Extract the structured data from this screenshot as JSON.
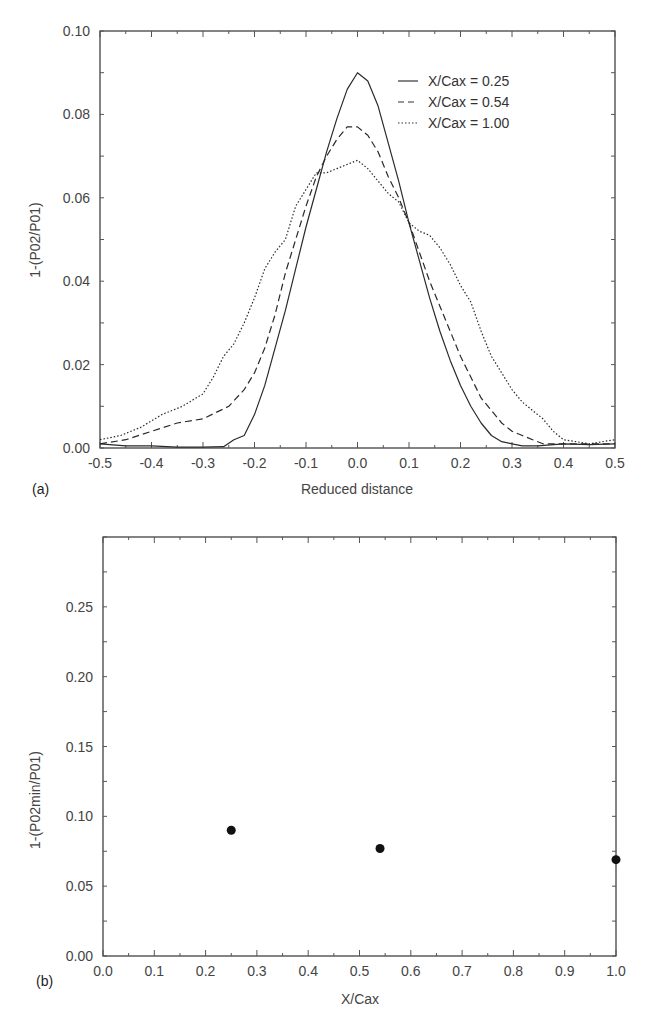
{
  "chart_data": [
    {
      "panel": "(a)",
      "type": "line",
      "xlabel": "Reduced distance",
      "ylabel": "1-(P02/P01)",
      "xlim": [
        -0.5,
        0.5
      ],
      "ylim": [
        0.0,
        0.1
      ],
      "xticks": [
        "-0.5",
        "-0.4",
        "-0.3",
        "-0.2",
        "-0.1",
        "0.0",
        "0.1",
        "0.2",
        "0.3",
        "0.4",
        "0.5"
      ],
      "yticks": [
        "0.00",
        "0.02",
        "0.04",
        "0.06",
        "0.08",
        "0.10"
      ],
      "grid": false,
      "legend_position": "upper right",
      "series": [
        {
          "name": "X/Cax = 0.25",
          "style": "solid",
          "x": [
            -0.5,
            -0.45,
            -0.4,
            -0.35,
            -0.3,
            -0.26,
            -0.24,
            -0.22,
            -0.2,
            -0.18,
            -0.16,
            -0.14,
            -0.12,
            -0.1,
            -0.08,
            -0.06,
            -0.04,
            -0.02,
            0.0,
            0.02,
            0.04,
            0.06,
            0.08,
            0.1,
            0.12,
            0.14,
            0.16,
            0.18,
            0.2,
            0.22,
            0.24,
            0.26,
            0.28,
            0.3,
            0.32,
            0.35,
            0.4,
            0.45,
            0.5
          ],
          "y": [
            0.001,
            0.0005,
            0.0005,
            0.0002,
            0.0002,
            0.0003,
            0.002,
            0.003,
            0.008,
            0.015,
            0.024,
            0.033,
            0.043,
            0.053,
            0.062,
            0.071,
            0.079,
            0.086,
            0.09,
            0.088,
            0.082,
            0.073,
            0.064,
            0.054,
            0.045,
            0.036,
            0.028,
            0.021,
            0.015,
            0.01,
            0.006,
            0.003,
            0.0015,
            0.001,
            0.0005,
            0.0005,
            0.001,
            0.0008,
            0.001
          ]
        },
        {
          "name": "X/Cax = 0.54",
          "style": "dashed",
          "x": [
            -0.5,
            -0.45,
            -0.4,
            -0.35,
            -0.3,
            -0.25,
            -0.22,
            -0.2,
            -0.18,
            -0.16,
            -0.14,
            -0.12,
            -0.1,
            -0.08,
            -0.06,
            -0.04,
            -0.02,
            0.0,
            0.02,
            0.04,
            0.06,
            0.08,
            0.1,
            0.12,
            0.14,
            0.16,
            0.18,
            0.2,
            0.22,
            0.24,
            0.26,
            0.28,
            0.3,
            0.32,
            0.34,
            0.36,
            0.38,
            0.4,
            0.45,
            0.5
          ],
          "y": [
            0.001,
            0.002,
            0.004,
            0.006,
            0.007,
            0.01,
            0.014,
            0.018,
            0.024,
            0.032,
            0.042,
            0.05,
            0.058,
            0.065,
            0.07,
            0.074,
            0.077,
            0.077,
            0.075,
            0.071,
            0.065,
            0.06,
            0.054,
            0.047,
            0.04,
            0.034,
            0.028,
            0.022,
            0.017,
            0.012,
            0.009,
            0.006,
            0.004,
            0.003,
            0.002,
            0.001,
            0.001,
            0.001,
            0.001,
            0.001
          ]
        },
        {
          "name": "X/Cax = 1.00",
          "style": "dotted",
          "x": [
            -0.5,
            -0.46,
            -0.42,
            -0.38,
            -0.34,
            -0.3,
            -0.28,
            -0.26,
            -0.24,
            -0.22,
            -0.2,
            -0.18,
            -0.16,
            -0.14,
            -0.12,
            -0.1,
            -0.08,
            -0.06,
            -0.04,
            -0.02,
            0.0,
            0.02,
            0.04,
            0.06,
            0.08,
            0.1,
            0.12,
            0.14,
            0.16,
            0.18,
            0.2,
            0.22,
            0.24,
            0.26,
            0.28,
            0.3,
            0.32,
            0.34,
            0.36,
            0.38,
            0.4,
            0.45,
            0.5
          ],
          "y": [
            0.002,
            0.003,
            0.005,
            0.008,
            0.01,
            0.013,
            0.017,
            0.022,
            0.025,
            0.03,
            0.036,
            0.043,
            0.047,
            0.05,
            0.058,
            0.062,
            0.066,
            0.066,
            0.067,
            0.068,
            0.069,
            0.067,
            0.064,
            0.061,
            0.059,
            0.054,
            0.052,
            0.051,
            0.048,
            0.044,
            0.039,
            0.035,
            0.028,
            0.022,
            0.018,
            0.014,
            0.011,
            0.009,
            0.007,
            0.004,
            0.002,
            0.001,
            0.002
          ]
        }
      ]
    },
    {
      "panel": "(b)",
      "type": "scatter",
      "xlabel": "X/Cax",
      "ylabel": "1-(P02min/P01)",
      "xlim": [
        0.0,
        1.0
      ],
      "ylim": [
        0.0,
        0.3
      ],
      "xticks": [
        "0.0",
        "0.1",
        "0.2",
        "0.3",
        "0.4",
        "0.5",
        "0.6",
        "0.7",
        "0.8",
        "0.9",
        "1.0"
      ],
      "yticks": [
        "0.00",
        "0.05",
        "0.10",
        "0.15",
        "0.20",
        "0.25"
      ],
      "grid": false,
      "series": [
        {
          "name": "minimum loss",
          "x": [
            0.25,
            0.54,
            1.0
          ],
          "y": [
            0.09,
            0.077,
            0.069
          ]
        }
      ]
    }
  ],
  "panels": {
    "a": {
      "label": "(a)",
      "xlabel": "Reduced distance",
      "ylabel": "1-(P02/P01)",
      "legend": [
        "X/Cax = 0.25",
        "X/Cax = 0.54",
        "X/Cax = 1.00"
      ]
    },
    "b": {
      "label": "(b)",
      "xlabel": "X/Cax",
      "ylabel": "1-(P02min/P01)"
    }
  },
  "colors": {
    "line": "#2a2a2a",
    "text": "#444444",
    "marker": "#111111"
  }
}
